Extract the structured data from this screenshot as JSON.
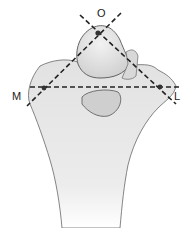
{
  "figure": {
    "labels": {
      "top": "O",
      "left": "M",
      "right": "L"
    },
    "colors": {
      "bone_fill": "#e4e4e4",
      "bone_shade": "#c9c9c9",
      "bone_outline": "#555555",
      "dashed_line": "#222222",
      "background": "#ffffff"
    },
    "points": {
      "O": [
        98,
        33
      ],
      "M": [
        44,
        88
      ],
      "L": [
        160,
        87
      ]
    }
  }
}
